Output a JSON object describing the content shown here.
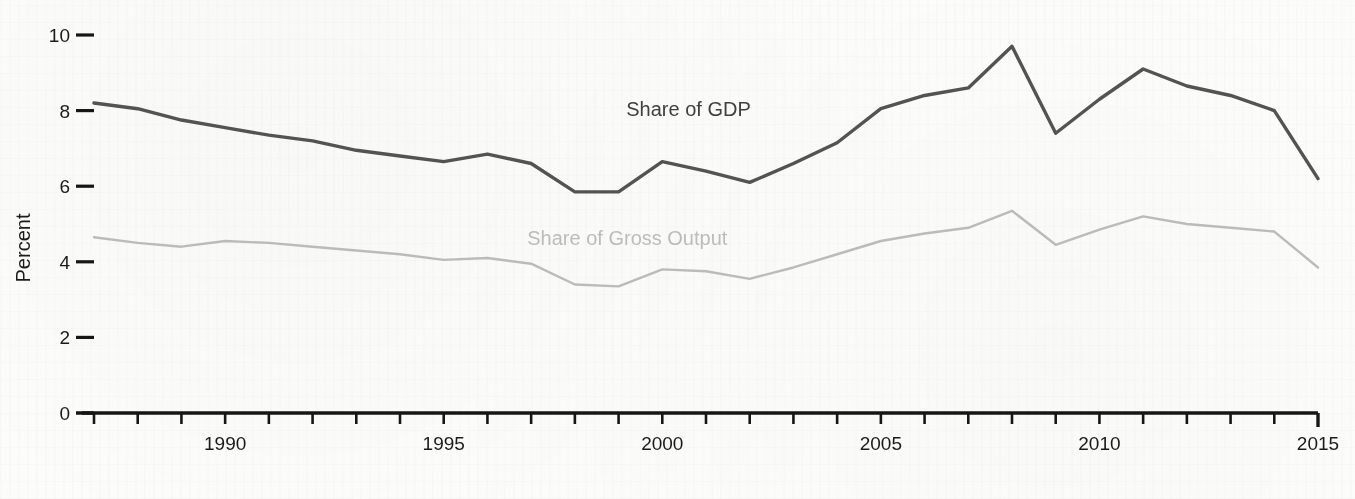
{
  "chart_data": {
    "type": "line",
    "title": "",
    "subtitle": "",
    "xlabel": "",
    "ylabel": "Percent",
    "xlim": [
      1987,
      2015
    ],
    "ylim": [
      0,
      10.6
    ],
    "yticks": [
      0,
      2,
      4,
      6,
      8,
      10
    ],
    "ytick_labels": [
      "0",
      "2",
      "4",
      "6",
      "8",
      "10"
    ],
    "xticks": [
      1987,
      1988,
      1989,
      1990,
      1991,
      1992,
      1993,
      1994,
      1995,
      1996,
      1997,
      1998,
      1999,
      2000,
      2001,
      2002,
      2003,
      2004,
      2005,
      2006,
      2007,
      2008,
      2009,
      2010,
      2011,
      2012,
      2013,
      2014,
      2015
    ],
    "xtick_labels": [
      "1990",
      "1995",
      "2000",
      "2005",
      "2010",
      "2015"
    ],
    "xtick_labeled_years": [
      1990,
      1995,
      2000,
      2005,
      2010,
      2015
    ],
    "grid": false,
    "legend_position": "inline-annotation",
    "x": [
      1987,
      1988,
      1989,
      1990,
      1991,
      1992,
      1993,
      1994,
      1995,
      1996,
      1997,
      1998,
      1999,
      2000,
      2001,
      2002,
      2003,
      2004,
      2005,
      2006,
      2007,
      2008,
      2009,
      2010,
      2011,
      2012,
      2013,
      2014,
      2015
    ],
    "series": [
      {
        "name": "Share of GDP",
        "color": "#4a4a4a",
        "label_x": 2000.6,
        "label_y": 7.85,
        "values": [
          8.2,
          8.05,
          7.75,
          7.55,
          7.35,
          7.2,
          6.95,
          6.8,
          6.65,
          6.85,
          6.6,
          5.85,
          5.85,
          6.65,
          6.4,
          6.1,
          6.6,
          7.15,
          8.05,
          8.4,
          8.6,
          9.7,
          7.4,
          8.3,
          9.1,
          8.65,
          8.4,
          8.0,
          6.2
        ]
      },
      {
        "name": "Share of Gross Output",
        "color": "#b4b4b4",
        "label_x": 1999.2,
        "label_y": 4.45,
        "values": [
          4.65,
          4.5,
          4.4,
          4.55,
          4.5,
          4.4,
          4.3,
          4.2,
          4.05,
          4.1,
          3.95,
          3.4,
          3.35,
          3.8,
          3.75,
          3.55,
          3.85,
          4.2,
          4.55,
          4.75,
          4.9,
          5.35,
          4.45,
          4.85,
          5.2,
          5.0,
          4.9,
          4.8,
          3.85
        ]
      }
    ]
  },
  "axes": {
    "ylabel": "Percent"
  },
  "annotations": {
    "gdp_label": "Share of GDP",
    "gross_output_label": "Share of Gross Output"
  }
}
